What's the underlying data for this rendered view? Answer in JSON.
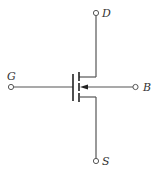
{
  "diagram": {
    "type": "circuit-symbol",
    "component": "n-channel enhancement MOSFET (4-terminal)",
    "terminals": [
      {
        "id": "drain",
        "label": "D"
      },
      {
        "id": "gate",
        "label": "G"
      },
      {
        "id": "body",
        "label": "B"
      },
      {
        "id": "source",
        "label": "S"
      }
    ],
    "colors": {
      "wire": "#555555",
      "plate": "#222222",
      "label": "#333333",
      "background": "#ffffff"
    }
  }
}
